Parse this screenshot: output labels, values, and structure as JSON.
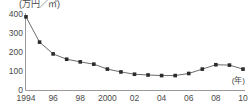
{
  "chart_data": {
    "type": "line",
    "title": "",
    "subtitle": "",
    "xlabel": "(年)",
    "ylabel": "(万円／㎡)",
    "xlim": [
      1994,
      2010
    ],
    "ylim": [
      0,
      400
    ],
    "yticks": [
      0,
      100,
      200,
      300,
      400
    ],
    "ytick_labels": [
      "0",
      "100",
      "200",
      "300",
      "400"
    ],
    "xticks": [
      1994,
      1996,
      1998,
      2000,
      2002,
      2004,
      2006,
      2008,
      2010
    ],
    "xtick_labels": [
      "1994",
      "96",
      "98",
      "2000",
      "02",
      "04",
      "06",
      "08",
      "10"
    ],
    "grid": false,
    "legend": null,
    "marker": "square",
    "line_color": "#4a4a4a",
    "marker_color": "#2b2b2b",
    "axis_color": "#8a8a8a",
    "x": [
      1994,
      1995,
      1996,
      1997,
      1998,
      1999,
      2000,
      2001,
      2002,
      2003,
      2004,
      2005,
      2006,
      2007,
      2008,
      2009,
      2010
    ],
    "values": [
      385,
      252,
      190,
      162,
      148,
      136,
      110,
      95,
      83,
      79,
      76,
      76,
      87,
      110,
      133,
      131,
      110
    ],
    "series": [
      {
        "name": "地価",
        "values": [
          385,
          252,
          190,
          162,
          148,
          136,
          110,
          95,
          83,
          79,
          76,
          76,
          87,
          110,
          133,
          131,
          110
        ]
      }
    ]
  }
}
